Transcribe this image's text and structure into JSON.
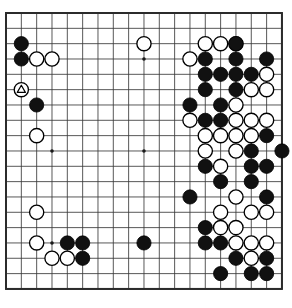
{
  "app": {
    "title": "Go Board Diagram",
    "kind": "goban-diagram"
  },
  "board": {
    "size": 19,
    "columns": 19,
    "rows": 19,
    "line_color": "#3a3a3a",
    "border_color": "#2b2b2b",
    "background_color": "#ffffff",
    "black_stone_color": "#111111",
    "white_stone_color": "#ffffff",
    "stone_outline_color": "#000000",
    "marker_color": "#000000",
    "origin_x": 6,
    "origin_y": 13,
    "cell_size": 15.33,
    "stone_radius": 7.1,
    "star_points": [
      {
        "col": 4,
        "row": 4
      },
      {
        "col": 10,
        "row": 4
      },
      {
        "col": 16,
        "row": 4
      },
      {
        "col": 4,
        "row": 10
      },
      {
        "col": 10,
        "row": 10
      },
      {
        "col": 16,
        "row": 10
      },
      {
        "col": 4,
        "row": 16
      },
      {
        "col": 10,
        "row": 16
      },
      {
        "col": 16,
        "row": 16
      }
    ],
    "stones": [
      {
        "col": 2,
        "row": 3,
        "color": "black"
      },
      {
        "col": 16,
        "row": 3,
        "color": "white"
      },
      {
        "col": 10,
        "row": 3,
        "color": "white"
      },
      {
        "col": 14,
        "row": 3,
        "color": "white"
      },
      {
        "col": 15,
        "row": 3,
        "color": "white"
      },
      {
        "col": 16,
        "row": 3,
        "color": "black"
      },
      {
        "col": 2,
        "row": 4,
        "color": "black"
      },
      {
        "col": 3,
        "row": 4,
        "color": "white"
      },
      {
        "col": 4,
        "row": 4,
        "color": "white"
      },
      {
        "col": 13,
        "row": 4,
        "color": "white"
      },
      {
        "col": 14,
        "row": 4,
        "color": "black"
      },
      {
        "col": 16,
        "row": 4,
        "color": "black"
      },
      {
        "col": 18,
        "row": 4,
        "color": "black"
      },
      {
        "col": 14,
        "row": 5,
        "color": "black"
      },
      {
        "col": 15,
        "row": 5,
        "color": "black"
      },
      {
        "col": 16,
        "row": 5,
        "color": "black"
      },
      {
        "col": 17,
        "row": 5,
        "color": "black"
      },
      {
        "col": 18,
        "row": 5,
        "color": "white"
      },
      {
        "col": 2,
        "row": 6,
        "color": "white",
        "mark": "triangle"
      },
      {
        "col": 14,
        "row": 6,
        "color": "black"
      },
      {
        "col": 16,
        "row": 6,
        "color": "black"
      },
      {
        "col": 17,
        "row": 6,
        "color": "white"
      },
      {
        "col": 18,
        "row": 6,
        "color": "white"
      },
      {
        "col": 3,
        "row": 7,
        "color": "black"
      },
      {
        "col": 13,
        "row": 7,
        "color": "black"
      },
      {
        "col": 15,
        "row": 7,
        "color": "black"
      },
      {
        "col": 16,
        "row": 7,
        "color": "white"
      },
      {
        "col": 13,
        "row": 8,
        "color": "white"
      },
      {
        "col": 14,
        "row": 8,
        "color": "black"
      },
      {
        "col": 15,
        "row": 8,
        "color": "black"
      },
      {
        "col": 16,
        "row": 8,
        "color": "white"
      },
      {
        "col": 17,
        "row": 8,
        "color": "white"
      },
      {
        "col": 18,
        "row": 8,
        "color": "white"
      },
      {
        "col": 3,
        "row": 9,
        "color": "white"
      },
      {
        "col": 14,
        "row": 9,
        "color": "white"
      },
      {
        "col": 15,
        "row": 9,
        "color": "white"
      },
      {
        "col": 16,
        "row": 9,
        "color": "white"
      },
      {
        "col": 17,
        "row": 9,
        "color": "white"
      },
      {
        "col": 18,
        "row": 9,
        "color": "black"
      },
      {
        "col": 14,
        "row": 10,
        "color": "white"
      },
      {
        "col": 16,
        "row": 10,
        "color": "white"
      },
      {
        "col": 17,
        "row": 10,
        "color": "black"
      },
      {
        "col": 19,
        "row": 10,
        "color": "black"
      },
      {
        "col": 14,
        "row": 11,
        "color": "black"
      },
      {
        "col": 15,
        "row": 11,
        "color": "white"
      },
      {
        "col": 17,
        "row": 11,
        "color": "black"
      },
      {
        "col": 18,
        "row": 11,
        "color": "black"
      },
      {
        "col": 15,
        "row": 12,
        "color": "black"
      },
      {
        "col": 17,
        "row": 12,
        "color": "black"
      },
      {
        "col": 13,
        "row": 13,
        "color": "black"
      },
      {
        "col": 16,
        "row": 13,
        "color": "white"
      },
      {
        "col": 18,
        "row": 13,
        "color": "black"
      },
      {
        "col": 15,
        "row": 14,
        "color": "white"
      },
      {
        "col": 17,
        "row": 14,
        "color": "white"
      },
      {
        "col": 18,
        "row": 14,
        "color": "white"
      },
      {
        "col": 3,
        "row": 14,
        "color": "white"
      },
      {
        "col": 14,
        "row": 15,
        "color": "black"
      },
      {
        "col": 15,
        "row": 15,
        "color": "white"
      },
      {
        "col": 16,
        "row": 15,
        "color": "white"
      },
      {
        "col": 3,
        "row": 16,
        "color": "white"
      },
      {
        "col": 5,
        "row": 16,
        "color": "black"
      },
      {
        "col": 6,
        "row": 16,
        "color": "black"
      },
      {
        "col": 10,
        "row": 16,
        "color": "black"
      },
      {
        "col": 14,
        "row": 16,
        "color": "black"
      },
      {
        "col": 15,
        "row": 16,
        "color": "black"
      },
      {
        "col": 16,
        "row": 16,
        "color": "white"
      },
      {
        "col": 17,
        "row": 16,
        "color": "white"
      },
      {
        "col": 18,
        "row": 16,
        "color": "white"
      },
      {
        "col": 4,
        "row": 17,
        "color": "white"
      },
      {
        "col": 5,
        "row": 17,
        "color": "white"
      },
      {
        "col": 6,
        "row": 17,
        "color": "black"
      },
      {
        "col": 16,
        "row": 17,
        "color": "black"
      },
      {
        "col": 17,
        "row": 17,
        "color": "white"
      },
      {
        "col": 18,
        "row": 17,
        "color": "black"
      },
      {
        "col": 15,
        "row": 18,
        "color": "black"
      },
      {
        "col": 17,
        "row": 18,
        "color": "black"
      },
      {
        "col": 18,
        "row": 18,
        "color": "black"
      }
    ]
  },
  "chart_data": {
    "type": "table",
    "xlabel": "column (1-19, left to right)",
    "ylabel": "row (1-19, top to bottom)",
    "black_stone_count": 43,
    "white_stone_count": 33,
    "marked_stones": [
      {
        "col": 2,
        "row": 6,
        "color": "white",
        "mark": "triangle"
      }
    ]
  }
}
